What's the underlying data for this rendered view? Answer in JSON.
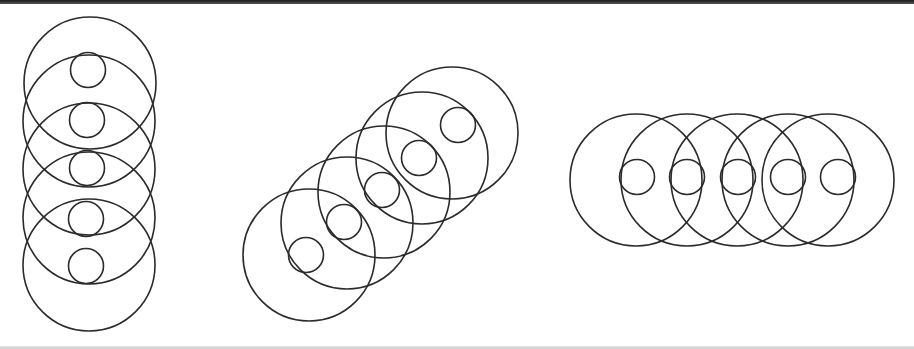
{
  "figure": {
    "stroke_color": "#2b2b2b",
    "background": "#ffffff",
    "big_radius": 66,
    "small_radius": 17.5,
    "groups": [
      {
        "name": "vertical-stack",
        "big": [
          [
            90,
            83
          ],
          [
            89,
            121
          ],
          [
            89,
            169
          ],
          [
            89,
            218
          ],
          [
            89,
            265
          ]
        ],
        "small": [
          [
            88,
            70
          ],
          [
            87,
            120
          ],
          [
            87,
            168
          ],
          [
            86,
            219
          ],
          [
            86,
            266
          ]
        ]
      },
      {
        "name": "diagonal-stack",
        "big": [
          [
            309,
            255
          ],
          [
            347,
            223
          ],
          [
            384,
            192
          ],
          [
            422,
            158
          ],
          [
            452,
            133
          ]
        ],
        "small": [
          [
            306,
            255
          ],
          [
            344,
            222
          ],
          [
            382,
            190
          ],
          [
            419,
            158
          ],
          [
            458,
            125
          ]
        ]
      },
      {
        "name": "horizontal-stack",
        "big": [
          [
            636,
            180
          ],
          [
            687,
            180
          ],
          [
            737,
            180
          ],
          [
            788,
            180
          ],
          [
            828,
            180
          ]
        ],
        "small": [
          [
            637,
            177
          ],
          [
            687,
            177
          ],
          [
            738,
            177
          ],
          [
            788,
            177
          ],
          [
            838,
            177
          ]
        ]
      }
    ]
  }
}
